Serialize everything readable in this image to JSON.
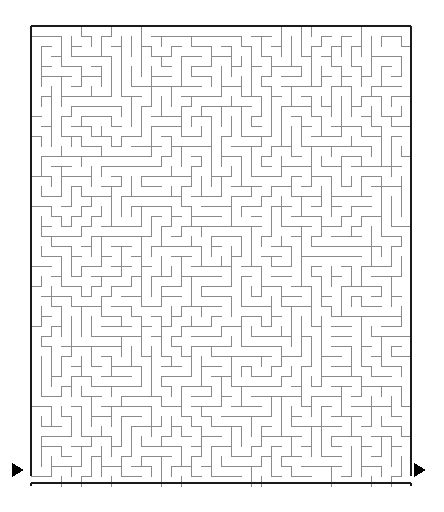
{
  "puzzle": {
    "type": "maze",
    "title": "Rectangular Grid Maze",
    "shape": "rectangle"
  },
  "canvas": {
    "width": 444,
    "height": 512,
    "background_color": "#ffffff"
  },
  "maze": {
    "origin_x": 31,
    "origin_y": 26,
    "cols": 38,
    "rows": 46,
    "cell_size": 10,
    "interior_width": 380,
    "interior_height": 457,
    "wall_color": "#8a8a8a",
    "wall_width": 1,
    "border_color": "#1a1a1a",
    "border_width": 2.4,
    "seed": 20240917
  },
  "entrance": {
    "label": "entrance-arrow",
    "glyph": "triangle-right",
    "color": "#000000",
    "x": 12,
    "y": 470,
    "size": 14,
    "side": "left",
    "opening_col": 0,
    "opening_row": 45
  },
  "exit": {
    "label": "exit-arrow",
    "glyph": "triangle-right",
    "color": "#000000",
    "x": 414,
    "y": 470,
    "size": 14,
    "side": "right",
    "opening_col": 37,
    "opening_row": 45
  },
  "chart_data": {
    "type": "table",
    "categories": [
      "columns",
      "rows",
      "cell_size_px",
      "interior_width_px",
      "interior_height_px"
    ],
    "values": [
      38,
      46,
      10,
      380,
      457
    ],
    "xlabel": "",
    "ylabel": "",
    "annotations": [
      "Entrance marker (solid right-pointing triangle) at lower-left outside the frame",
      "Exit marker (solid right-pointing triangle) at lower-right outside the frame",
      "Outer frame drawn with a thick near-black stroke",
      "Interior passage walls drawn with thin grey strokes"
    ]
  }
}
